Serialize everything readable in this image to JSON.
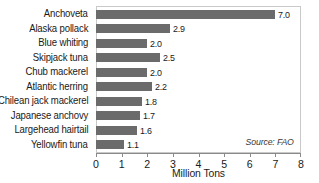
{
  "chart_data": {
    "type": "bar",
    "orientation": "horizontal",
    "title": "",
    "xlabel": "Million Tons",
    "ylabel": "",
    "xlim": [
      0,
      8
    ],
    "xticks": [
      "0",
      "1",
      "2",
      "3",
      "4",
      "5",
      "6",
      "7",
      "8"
    ],
    "grid": false,
    "legend": null,
    "annotation": "Source: FAO",
    "categories": [
      "Anchoveta",
      "Alaska pollack",
      "Blue whiting",
      "Skipjack tuna",
      "Chub mackerel",
      "Atlantic herring",
      "Chilean jack mackerel",
      "Japanese anchovy",
      "Largehead hairtail",
      "Yellowfin tuna"
    ],
    "values": [
      7.0,
      2.9,
      2.0,
      2.5,
      2.0,
      2.2,
      1.8,
      1.7,
      1.6,
      1.1
    ],
    "value_labels": [
      "7.0",
      "2.9",
      "2.0",
      "2.5",
      "2.0",
      "2.2",
      "1.8",
      "1.7",
      "1.6",
      "1.1"
    ],
    "bar_color": "#6b6b6b",
    "frame_color": "#c9c9c9",
    "axis_color": "#8a8a8a",
    "background": "#ffffff"
  }
}
